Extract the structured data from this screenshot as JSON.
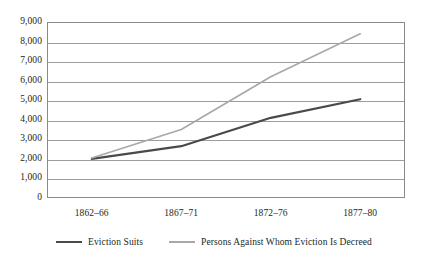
{
  "chart_data": {
    "type": "line",
    "title": "",
    "subtitle": "",
    "xlabel": "",
    "ylabel": "",
    "categories": [
      "1862–66",
      "1867–71",
      "1872–76",
      "1877–80"
    ],
    "ylim": [
      0,
      9000
    ],
    "ytick_step": 1000,
    "ytick_labels": [
      "0",
      "1,000",
      "2,000",
      "3,000",
      "4,000",
      "5,000",
      "6,000",
      "7,000",
      "8,000",
      "9,000"
    ],
    "ytick_values": [
      0,
      1000,
      2000,
      3000,
      4000,
      5000,
      6000,
      7000,
      8000,
      9000
    ],
    "grid": true,
    "grid_axis": "y",
    "legend_position": "bottom",
    "series": [
      {
        "name": "Eviction Suits",
        "color": "#4a4a4a",
        "values": [
          2000,
          2650,
          4100,
          5050
        ]
      },
      {
        "name": "Persons Against Whom Eviction Is Decreed",
        "color": "#a8a8a8",
        "values": [
          2050,
          3500,
          6200,
          8400
        ]
      }
    ]
  },
  "legend": {
    "entries": [
      {
        "label": "Eviction Suits"
      },
      {
        "label": "Persons Against Whom Eviction Is Decreed"
      }
    ]
  },
  "colors": {
    "series_1": "#4a4a4a",
    "series_2": "#a8a8a8",
    "gridline": "#9c9c9c",
    "frame": "#8a8a8a",
    "text": "#231f20",
    "background": "#ffffff"
  }
}
